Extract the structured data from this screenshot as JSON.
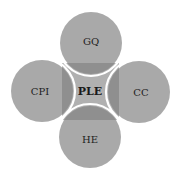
{
  "diagram": {
    "type": "four-circle-hub",
    "center": {
      "label": "PLE",
      "color": "#ababab"
    },
    "nodes": [
      {
        "id": "top",
        "label": "GQ",
        "color": "#a8a8a8"
      },
      {
        "id": "left",
        "label": "CPI",
        "color": "#a8a8a8"
      },
      {
        "id": "right",
        "label": "CC",
        "color": "#a8a8a8"
      },
      {
        "id": "bottom",
        "label": "HE",
        "color": "#a8a8a8"
      }
    ],
    "overlap_color": "#8c8c8c",
    "separator_color": "#ffffff"
  }
}
